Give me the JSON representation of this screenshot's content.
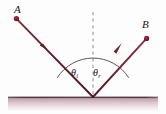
{
  "figure": {
    "type": "ray-reflection-diagram",
    "width": 166,
    "height": 114,
    "background_color": "#fefdfd",
    "colors": {
      "ray": "#6b2535",
      "ray_dark": "#4e1a28",
      "dot": "#7d1f2e",
      "normal_dashed": "#9a9a9a",
      "arc": "#4a3338",
      "surface_top_line": "#55414a",
      "surface_fill_top": "#c9a9b3",
      "surface_fill_bottom": "#f7f2f4",
      "label_text": "#1a1417"
    },
    "labels": {
      "point_a": "A",
      "point_b": "B",
      "theta_incident_symbol": "θ",
      "theta_incident_subscript": "i",
      "theta_reflected_symbol": "θ",
      "theta_reflected_subscript": "r"
    },
    "geometry": {
      "vertex": {
        "x": 93,
        "y": 97
      },
      "point_a": {
        "x": 16,
        "y": 18
      },
      "point_b": {
        "x": 147,
        "y": 38
      },
      "incident_arrow": {
        "x": 44,
        "y": 46
      },
      "reflected_arrow": {
        "x": 118,
        "y": 48
      },
      "normal_line": {
        "x": 93,
        "y_top": 12,
        "y_bottom": 97
      },
      "arc_radius": 42,
      "surface": {
        "x_start": 8,
        "x_end": 158,
        "y": 97,
        "thickness": 14
      },
      "dot_radius": 2.6
    }
  }
}
